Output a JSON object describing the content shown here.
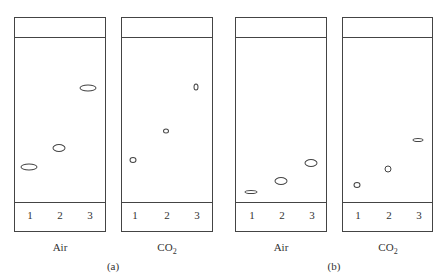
{
  "figure": {
    "groups": [
      {
        "caption": "(a)",
        "plates": [
          {
            "label_main": "Air",
            "label_sub": "",
            "lanes": [
              "1",
              "2",
              "3"
            ],
            "spots": [
              {
                "lane": "1",
                "x": 29,
                "y": 167,
                "w": 17,
                "h": 7
              },
              {
                "lane": "2",
                "x": 59,
                "y": 148,
                "w": 13,
                "h": 8
              },
              {
                "lane": "3",
                "x": 88,
                "y": 88,
                "w": 17,
                "h": 7
              }
            ]
          },
          {
            "label_main": "CO",
            "label_sub": "2",
            "lanes": [
              "1",
              "2",
              "3"
            ],
            "spots": [
              {
                "lane": "1",
                "x": 133,
                "y": 160,
                "w": 7,
                "h": 6
              },
              {
                "lane": "2",
                "x": 166,
                "y": 131,
                "w": 6,
                "h": 5
              },
              {
                "lane": "3",
                "x": 196,
                "y": 87,
                "w": 5,
                "h": 7
              }
            ]
          }
        ]
      },
      {
        "caption": "(b)",
        "plates": [
          {
            "label_main": "Air",
            "label_sub": "",
            "lanes": [
              "1",
              "2",
              "3"
            ],
            "spots": [
              {
                "lane": "1",
                "x": 251,
                "y": 192,
                "w": 13,
                "h": 4
              },
              {
                "lane": "2",
                "x": 281,
                "y": 181,
                "w": 13,
                "h": 8
              },
              {
                "lane": "3",
                "x": 311,
                "y": 163,
                "w": 13,
                "h": 8
              }
            ]
          },
          {
            "label_main": "CO",
            "label_sub": "2",
            "lanes": [
              "1",
              "2",
              "3"
            ],
            "spots": [
              {
                "lane": "1",
                "x": 357,
                "y": 185,
                "w": 7,
                "h": 6
              },
              {
                "lane": "2",
                "x": 388,
                "y": 169,
                "w": 7,
                "h": 7
              },
              {
                "lane": "3",
                "x": 418,
                "y": 140,
                "w": 11,
                "h": 4
              }
            ]
          }
        ]
      }
    ]
  },
  "colors": {
    "line": "#444444",
    "background": "#ffffff"
  }
}
